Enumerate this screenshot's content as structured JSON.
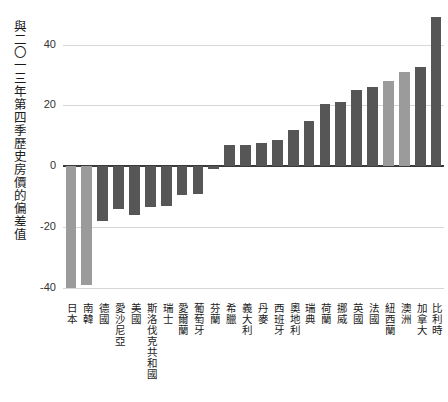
{
  "chart_data": {
    "type": "bar",
    "title": "",
    "subtitle": "",
    "xlabel": "",
    "ylabel": "與二〇一三年第四季歷史房價的偏差值",
    "ylim": [
      -44,
      52
    ],
    "yticks": [
      40,
      20,
      0,
      -20,
      -40
    ],
    "ytick_labels": [
      "40",
      "20",
      "0",
      "-20",
      "-40"
    ],
    "grid": true,
    "legend": "none",
    "categories": [
      "日本",
      "南韓",
      "德國",
      "愛沙尼亞",
      "美國",
      "斯洛伐克共和國",
      "瑞士",
      "愛爾蘭",
      "葡萄牙",
      "芬蘭",
      "希臘",
      "義大利",
      "丹麥",
      "西班牙",
      "奧地利",
      "瑞典",
      "荷蘭",
      "挪威",
      "英國",
      "法國",
      "紐西蘭",
      "澳洲",
      "加拿大",
      "比利時"
    ],
    "values": [
      -40.0,
      -39.0,
      -18.0,
      -14.0,
      -16.0,
      -13.5,
      -13.0,
      -9.5,
      -9.0,
      -1.0,
      7.0,
      7.0,
      7.5,
      8.5,
      12.0,
      15.0,
      20.5,
      21.0,
      25.0,
      26.0,
      28.0,
      31.0,
      32.5,
      49.0
    ],
    "bar_shades": [
      "light",
      "light",
      "dark",
      "dark",
      "dark",
      "dark",
      "dark",
      "dark",
      "dark",
      "dark",
      "dark",
      "dark",
      "dark",
      "dark",
      "dark",
      "dark",
      "dark",
      "dark",
      "dark",
      "dark",
      "light",
      "light",
      "dark",
      "dark"
    ],
    "colors": {
      "bar_light": "#9b9b9b",
      "bar_dark": "#565656",
      "gridline": "#d7d7d7",
      "zero_axis": "#3a3a3a",
      "text": "#1a1a1a",
      "background": "#ffffff"
    }
  }
}
